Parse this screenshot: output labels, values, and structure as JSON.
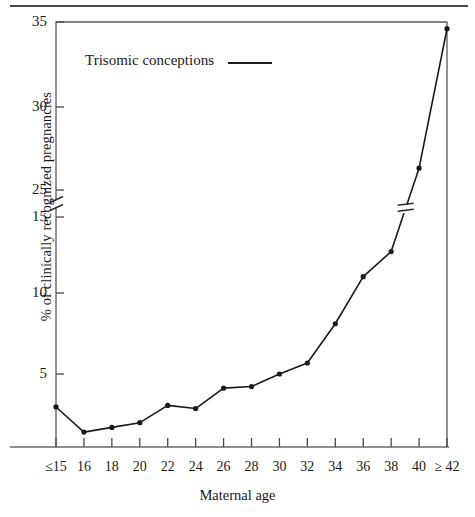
{
  "figure": {
    "has_top_rule": true
  },
  "legend": {
    "label": "Trisomic conceptions",
    "marker": "solid-line"
  },
  "axes": {
    "x_title": "Maternal age",
    "y_title": "% of clinically recognized pregnancies"
  },
  "chart_data": {
    "type": "line",
    "title": "",
    "subtitle": "",
    "xlabel": "Maternal age",
    "ylabel": "% of clinically recognized pregnancies",
    "grid": false,
    "legend_position": "upper-left-inside",
    "axis_break": {
      "present": true,
      "axis": "y",
      "between": [
        15,
        25
      ],
      "marker": "double-slash-break"
    },
    "x_tick_labels": [
      "≤15",
      "16",
      "18",
      "20",
      "22",
      "24",
      "26",
      "28",
      "30",
      "32",
      "34",
      "36",
      "38",
      "40",
      "≥ 42"
    ],
    "y_tick_labels": [
      "5",
      "10",
      "15",
      "25",
      "30",
      "35"
    ],
    "y_ticks_lower_segment": [
      5,
      10,
      15
    ],
    "y_ticks_upper_segment": [
      25,
      30,
      35
    ],
    "ylim_lower": [
      0,
      15
    ],
    "ylim_upper": [
      25,
      35
    ],
    "categories": [
      "≤15",
      "16",
      "18",
      "20",
      "22",
      "24",
      "26",
      "28",
      "30",
      "32",
      "34",
      "36",
      "38",
      "40",
      "≥ 42"
    ],
    "series": [
      {
        "name": "Trisomic conceptions",
        "color": "#1a1a1a",
        "marker": "filled-circle",
        "values": [
          2.9,
          1.3,
          1.6,
          1.9,
          3.0,
          2.8,
          4.1,
          4.2,
          5.0,
          5.7,
          8.2,
          11.2,
          12.8,
          26.3,
          34.6
        ]
      }
    ],
    "annotations": []
  },
  "geometry": {
    "plot_left": 56,
    "plot_right": 447,
    "plot_top": 22,
    "plot_bottom": 447,
    "y_pixels": {
      "5": 374,
      "10": 293,
      "15": 217,
      "25": 190,
      "30": 107,
      "35": 22
    },
    "point_pixels": [
      {
        "x": 56,
        "y": 408
      },
      {
        "x": 84,
        "y": 434
      },
      {
        "x": 112,
        "y": 430
      },
      {
        "x": 140,
        "y": 425
      },
      {
        "x": 168,
        "y": 407
      },
      {
        "x": 196,
        "y": 410
      },
      {
        "x": 224,
        "y": 388
      },
      {
        "x": 252,
        "y": 386
      },
      {
        "x": 280,
        "y": 374
      },
      {
        "x": 308,
        "y": 363
      },
      {
        "x": 335,
        "y": 321
      },
      {
        "x": 363,
        "y": 271
      },
      {
        "x": 391,
        "y": 247
      },
      {
        "x": 419,
        "y": 143
      },
      {
        "x": 447,
        "y": 32
      }
    ]
  }
}
